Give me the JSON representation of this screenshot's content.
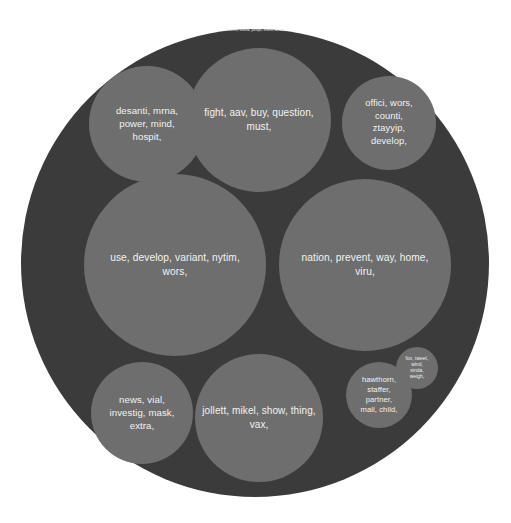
{
  "chart_data": {
    "type": "circle-packing",
    "title": "",
    "background_color": "#ffffff",
    "root": {
      "label": "deaths, covid, peopl, elect, dead,",
      "fill": "#3b3b3b",
      "cx": 255,
      "cy": 263,
      "r": 234,
      "label_font_size": 4.1,
      "label_cy": 31
    },
    "nodes": [
      {
        "id": "cluster-1",
        "fill": "#6e6e6e",
        "cx": 147,
        "cy": 124,
        "r": 58,
        "font_size": 9.6,
        "line_height": 13,
        "lines": [
          "desanti, mrna,",
          "power, mind,",
          "hospit,"
        ]
      },
      {
        "id": "cluster-2",
        "fill": "#6e6e6e",
        "cx": 259,
        "cy": 120,
        "r": 72,
        "font_size": 10,
        "line_height": 13.5,
        "lines": [
          "fight, aav, buy, question,",
          "must,"
        ]
      },
      {
        "id": "cluster-3",
        "fill": "#6e6e6e",
        "cx": 389,
        "cy": 123,
        "r": 47,
        "font_size": 9.3,
        "line_height": 12.5,
        "lines": [
          "offici, wors,",
          "counti,",
          "ztayyip,",
          "develop,"
        ]
      },
      {
        "id": "cluster-4",
        "fill": "#6e6e6e",
        "cx": 175,
        "cy": 265,
        "r": 91,
        "font_size": 10.2,
        "line_height": 14,
        "lines": [
          "use, develop, variant, nytim,",
          "wors,"
        ]
      },
      {
        "id": "cluster-5",
        "fill": "#6e6e6e",
        "cx": 365,
        "cy": 265,
        "r": 86,
        "font_size": 10.2,
        "line_height": 14,
        "lines": [
          "nation, prevent, way, home,",
          "viru,"
        ]
      },
      {
        "id": "cluster-6",
        "fill": "#6e6e6e",
        "cx": 142,
        "cy": 413,
        "r": 51,
        "font_size": 9.6,
        "line_height": 13,
        "lines": [
          "news, vial,",
          "investig, mask,",
          "extra,"
        ]
      },
      {
        "id": "cluster-7",
        "fill": "#6e6e6e",
        "cx": 259,
        "cy": 418,
        "r": 64,
        "font_size": 10,
        "line_height": 13.5,
        "lines": [
          "jollett, mikel, show, thing,",
          "vax,"
        ]
      },
      {
        "id": "cluster-8",
        "fill": "#6e6e6e",
        "cx": 379,
        "cy": 395,
        "r": 33,
        "font_size": 7.6,
        "line_height": 10,
        "lines": [
          "hawthorn,",
          "staffer,",
          "partner,",
          "mail, child,"
        ]
      },
      {
        "id": "cluster-9",
        "fill": "#6e6e6e",
        "cx": 417,
        "cy": 368,
        "r": 21,
        "font_size": 4.8,
        "line_height": 6.2,
        "lines": [
          "fox, tweet,",
          "wind,",
          "sinda,",
          "weigh,"
        ]
      }
    ]
  }
}
